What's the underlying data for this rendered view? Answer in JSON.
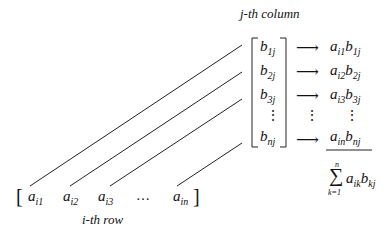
{
  "labels": {
    "column": "j-th column",
    "row": "i-th row"
  },
  "row_vector": {
    "open": "[",
    "close": "]",
    "entries": [
      {
        "base": "a",
        "sub": "i1"
      },
      {
        "base": "a",
        "sub": "i2"
      },
      {
        "base": "a",
        "sub": "i3"
      },
      {
        "base": "…",
        "sub": ""
      },
      {
        "base": "a",
        "sub": "in"
      }
    ]
  },
  "column_vector": {
    "entries": [
      {
        "base": "b",
        "sub": "1j"
      },
      {
        "base": "b",
        "sub": "2j"
      },
      {
        "base": "b",
        "sub": "3j"
      },
      {
        "base": "⋮",
        "sub": ""
      },
      {
        "base": "b",
        "sub": "nj"
      }
    ]
  },
  "arrow": "⟶",
  "products": [
    {
      "a": "a",
      "as": "i1",
      "b": "b",
      "bs": "1j"
    },
    {
      "a": "a",
      "as": "i2",
      "b": "b",
      "bs": "2j"
    },
    {
      "a": "a",
      "as": "i3",
      "b": "b",
      "bs": "3j"
    },
    {
      "a": "⋮",
      "as": "",
      "b": "",
      "bs": ""
    },
    {
      "a": "a",
      "as": "in",
      "b": "b",
      "bs": "nj"
    }
  ],
  "sum": {
    "symbol": "∑",
    "upper": "n",
    "lower": "k=1",
    "a": "a",
    "as": "ik",
    "b": "b",
    "bs": "kj"
  }
}
